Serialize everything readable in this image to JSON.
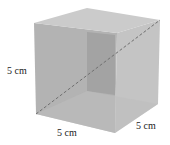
{
  "figure": {
    "shape": "cube",
    "colors": {
      "left_face": "#b0b0b0",
      "right_face": "#c2c2c2",
      "top_face": "#c9c9c9",
      "back_panel": "#9f9f9f",
      "diagonal": "#6f6f6f",
      "label": "#222222"
    },
    "labels": {
      "height": "5 cm",
      "width": "5 cm",
      "depth": "5 cm"
    }
  }
}
